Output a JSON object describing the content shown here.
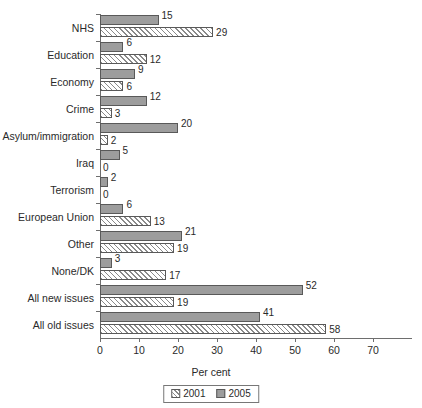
{
  "chart_data": {
    "type": "bar",
    "orientation": "horizontal",
    "title": "",
    "xlabel": "Per cent",
    "ylabel": "",
    "xlim": [
      0,
      70
    ],
    "xticks": [
      0,
      10,
      20,
      30,
      40,
      50,
      60,
      70
    ],
    "xtick_labels": [
      "0",
      "10",
      "20",
      "30",
      "40",
      "50",
      "60",
      "70"
    ],
    "grid": false,
    "legend_position": "bottom-center",
    "categories": [
      "NHS",
      "Education",
      "Economy",
      "Crime",
      "Asylum/immigration",
      "Iraq",
      "Terrorism",
      "European Union",
      "Other",
      "None/DK",
      "All new issues",
      "All old issues"
    ],
    "series": [
      {
        "name": "2005",
        "fill": "solid-grey",
        "color": "#9d9d9d",
        "values": [
          15,
          6,
          9,
          12,
          20,
          5,
          2,
          6,
          21,
          3,
          52,
          41
        ],
        "labels": [
          "15",
          "6",
          "9",
          "12",
          "20",
          "5",
          "2",
          "6",
          "21",
          "3",
          "52",
          "41"
        ]
      },
      {
        "name": "2001",
        "fill": "diagonal-hatch",
        "color": "#ffffff",
        "values": [
          29,
          12,
          6,
          3,
          2,
          0,
          0,
          13,
          19,
          17,
          19,
          58
        ],
        "labels": [
          "29",
          "12",
          "6",
          "3",
          "2",
          "0",
          "0",
          "13",
          "19",
          "17",
          "19",
          "58"
        ]
      }
    ],
    "legend": [
      "2001",
      "2005"
    ]
  }
}
